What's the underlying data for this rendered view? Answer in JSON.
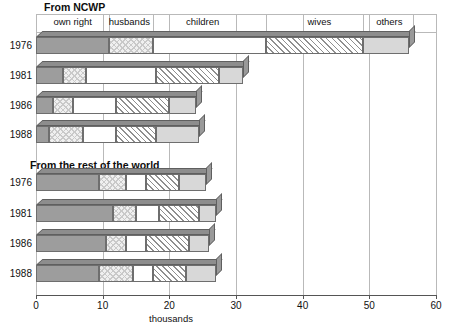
{
  "chart_data": {
    "type": "bar",
    "orientation": "horizontal",
    "stacked": true,
    "title": "",
    "xlabel": "thousands",
    "ylabel": "",
    "xlim": [
      0,
      60
    ],
    "xticks": [
      0,
      10,
      20,
      30,
      40,
      50,
      60
    ],
    "xtick_labels": [
      "0",
      "10",
      "20",
      "30",
      "40",
      "50",
      "60"
    ],
    "grid": true,
    "legend_position": "top-band",
    "categories": [
      "own right",
      "husbands",
      "children",
      "wives",
      "others"
    ],
    "groups": [
      {
        "name": "From NCWP",
        "categories": [
          "1976",
          "1981",
          "1986",
          "1988"
        ],
        "series": [
          {
            "name": "own right",
            "values": [
              11.0,
              4.0,
              2.5,
              2.0
            ]
          },
          {
            "name": "husbands",
            "values": [
              6.5,
              3.5,
              3.0,
              5.0
            ]
          },
          {
            "name": "children",
            "values": [
              17.0,
              10.5,
              6.5,
              5.0
            ]
          },
          {
            "name": "wives",
            "values": [
              14.5,
              9.5,
              8.0,
              6.0
            ]
          },
          {
            "name": "others",
            "values": [
              7.0,
              3.5,
              4.0,
              6.5
            ]
          }
        ],
        "totals": [
          56.0,
          31.0,
          24.0,
          24.5
        ]
      },
      {
        "name": "From the rest of the world",
        "categories": [
          "1976",
          "1981",
          "1986",
          "1988"
        ],
        "series": [
          {
            "name": "own right",
            "values": [
              9.5,
              11.5,
              10.5,
              9.5
            ]
          },
          {
            "name": "husbands",
            "values": [
              4.0,
              3.5,
              3.0,
              5.0
            ]
          },
          {
            "name": "children",
            "values": [
              3.0,
              3.5,
              3.0,
              3.0
            ]
          },
          {
            "name": "wives",
            "values": [
              5.0,
              6.0,
              6.5,
              5.0
            ]
          },
          {
            "name": "others",
            "values": [
              4.0,
              2.5,
              3.0,
              4.5
            ]
          }
        ],
        "totals": [
          25.5,
          27.0,
          26.0,
          27.0
        ]
      }
    ],
    "colors": {
      "own right": "#9d9d9d",
      "husbands": "#f0f0f0",
      "children": "#ffffff",
      "wives": "#ffffff",
      "others": "#d8d8d8",
      "grid": "#b9b9b9",
      "axis": "#555555",
      "outline": "#6e6e6e"
    }
  },
  "header": {
    "band_labels": [
      {
        "label": "own right",
        "center": 5.5
      },
      {
        "label": "husbands",
        "center": 14.0
      },
      {
        "label": "children",
        "center": 25.0
      },
      {
        "label": "wives",
        "center": 42.5
      },
      {
        "label": "others",
        "center": 53.0
      }
    ]
  },
  "sections": {
    "ncwp_title": "From NCWP",
    "row_title": "From the rest of the world"
  },
  "axis": {
    "tick_labels": [
      "0",
      "10",
      "20",
      "30",
      "40",
      "50",
      "60"
    ],
    "title": "thousands"
  }
}
